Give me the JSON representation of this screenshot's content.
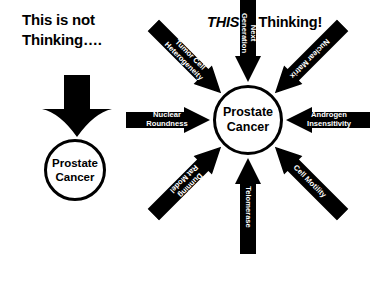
{
  "left": {
    "heading_line1": "This is not",
    "heading_line2": "Thinking….",
    "arrow_icon": "thick-down-arrow-icon",
    "circle": {
      "line1": "Prostate",
      "line2": "Cancer"
    }
  },
  "right": {
    "heading_emphasis": "THIS",
    "heading_rest": " is Thinking!",
    "hub": {
      "line1": "Prostate",
      "line2": "Cancer"
    },
    "arrows": [
      {
        "direction": "nw",
        "icon": "inward-arrow-icon",
        "line1": "Tumor Cell",
        "line2": "Heterogeneity"
      },
      {
        "direction": "n",
        "icon": "inward-arrow-icon",
        "line1": "Next",
        "line2": "Generation"
      },
      {
        "direction": "ne",
        "icon": "inward-arrow-icon",
        "line1": "Nuclear Matrix",
        "line2": ""
      },
      {
        "direction": "e",
        "icon": "inward-arrow-icon",
        "line1": "Androgen",
        "line2": "Insensitivity"
      },
      {
        "direction": "se",
        "icon": "inward-arrow-icon",
        "line1": "Cell Motility",
        "line2": ""
      },
      {
        "direction": "s",
        "icon": "inward-arrow-icon",
        "line1": "Telomerase",
        "line2": ""
      },
      {
        "direction": "sw",
        "icon": "inward-arrow-icon",
        "line1": "Dunning",
        "line2": "Rat Model"
      },
      {
        "direction": "w",
        "icon": "inward-arrow-icon",
        "line1": "Nuclear",
        "line2": "Roundness"
      }
    ]
  }
}
